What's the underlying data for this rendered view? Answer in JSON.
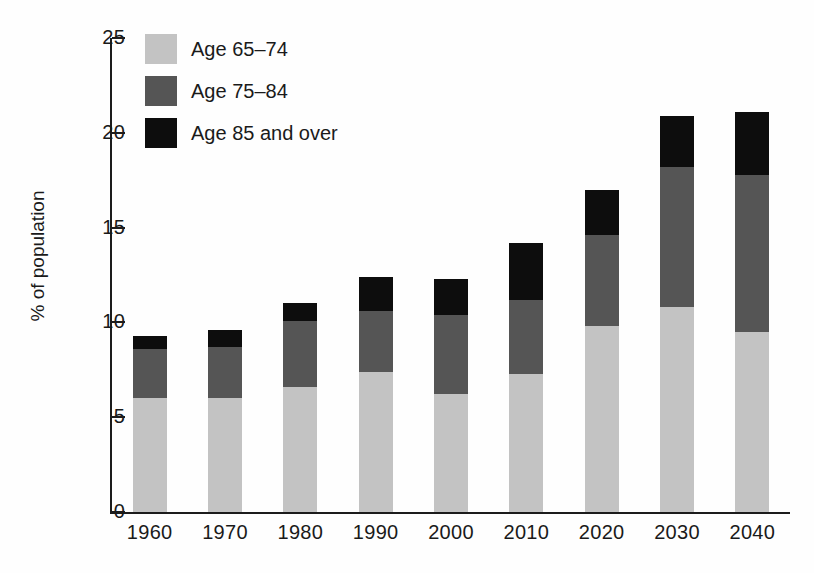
{
  "chart_data": {
    "type": "bar",
    "subtype": "stacked-bar",
    "title": "",
    "xlabel": "",
    "ylabel": "% of population",
    "ylim": [
      0,
      25
    ],
    "yticks": [
      0,
      5,
      10,
      15,
      20,
      25
    ],
    "ytick_labels": [
      "0",
      "5",
      "10",
      "15",
      "20",
      "25"
    ],
    "grid": false,
    "legend_position": "top-left",
    "categories": [
      "1960",
      "1970",
      "1980",
      "1990",
      "2000",
      "2010",
      "2020",
      "2030",
      "2040"
    ],
    "series": [
      {
        "name": "Age 65–74",
        "color": "#c3c3c3",
        "values": [
          6.0,
          6.0,
          6.6,
          7.4,
          6.2,
          7.3,
          9.8,
          10.8,
          9.5
        ]
      },
      {
        "name": "Age 75–84",
        "color": "#555555",
        "values": [
          2.6,
          2.7,
          3.5,
          3.2,
          4.2,
          3.9,
          4.8,
          7.4,
          8.3
        ]
      },
      {
        "name": "Age 85 and over",
        "color": "#0d0d0d",
        "values": [
          0.7,
          0.9,
          0.9,
          1.8,
          1.9,
          3.0,
          2.4,
          2.7,
          3.3
        ]
      }
    ],
    "totals": [
      9.3,
      9.6,
      11.0,
      12.4,
      12.3,
      14.2,
      17.0,
      20.9,
      21.1
    ]
  },
  "axes": {
    "y_title": "% of population",
    "y_ticks": [
      "25",
      "20",
      "15",
      "10",
      "5",
      "0"
    ],
    "x_ticks": [
      "1960",
      "1970",
      "1980",
      "1990",
      "2000",
      "2010",
      "2020",
      "2030",
      "2040"
    ]
  },
  "legend": {
    "items": [
      {
        "label": "Age 65–74",
        "color": "#c3c3c3"
      },
      {
        "label": "Age 75–84",
        "color": "#555555"
      },
      {
        "label": "Age 85 and over",
        "color": "#0d0d0d"
      }
    ]
  }
}
